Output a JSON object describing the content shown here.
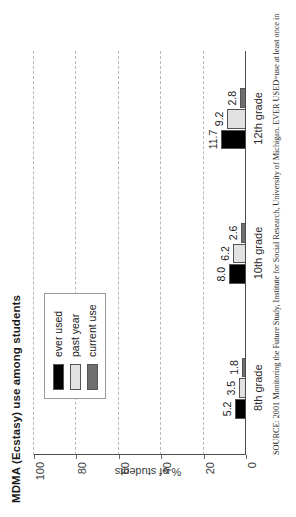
{
  "chart_data": {
    "type": "bar",
    "title": "MDMA (Ecstasy) use among students",
    "xlabel": "",
    "ylabel": "% of students",
    "categories": [
      "8th grade",
      "10th grade",
      "12th grade"
    ],
    "series": [
      {
        "name": "ever used",
        "color": "#000000",
        "values": [
          5.2,
          8.0,
          11.7
        ]
      },
      {
        "name": "past year",
        "color": "#e2e2e2",
        "values": [
          3.5,
          6.2,
          9.2
        ]
      },
      {
        "name": "current use",
        "color": "#6f6f6f",
        "values": [
          1.8,
          2.6,
          2.8
        ]
      }
    ],
    "ylim": [
      0,
      100
    ],
    "yticks": [
      0,
      20,
      40,
      60,
      80,
      100
    ],
    "ytick_labels": [
      "0",
      "20",
      "40",
      "60",
      "80",
      "100"
    ],
    "grid": true,
    "grid_axis": "y",
    "legend_position": "upper-left",
    "value_labels": [
      "5.2",
      "3.5",
      "1.8",
      "8.0",
      "6.2",
      "2.6",
      "11.7",
      "9.2",
      "2.8"
    ],
    "orientation": "rotated-90-ccw"
  },
  "source": {
    "note": "SOURCE: 2001 Monitoring the Future Study, Institute for Social Research, University of Michigan. EVER USED=use at least once in"
  }
}
